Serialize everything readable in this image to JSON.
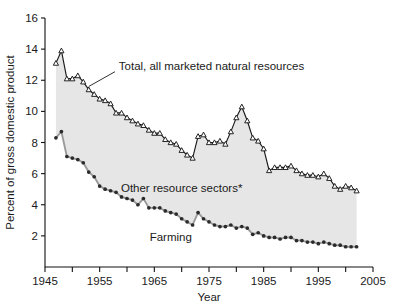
{
  "chart_data": {
    "type": "line",
    "title": "",
    "xlabel": "Year",
    "ylabel": "Percent of gross domestic product",
    "xlim": [
      1945,
      2005
    ],
    "ylim": [
      0,
      16
    ],
    "xticks": [
      1945,
      1950,
      1955,
      1960,
      1965,
      1970,
      1975,
      1980,
      1985,
      1990,
      1995,
      2000,
      2005
    ],
    "xticklabels": [
      "1945",
      "",
      "1955",
      "",
      "1965",
      "",
      "1975",
      "",
      "1985",
      "",
      "1995",
      "",
      "2005"
    ],
    "yticks": [
      2,
      4,
      6,
      8,
      10,
      12,
      14,
      16
    ],
    "yticklabels": [
      "2",
      "4",
      "6",
      "8",
      "10",
      "12",
      "14",
      "16"
    ],
    "grid": false,
    "legend_position": "inline-annotations",
    "annotations": [
      {
        "name": "total-series-label",
        "text": "Total, all marketed natural resources",
        "x": 1958.5,
        "y": 12.9
      },
      {
        "name": "band-label",
        "text": "Other resource sectors*",
        "x": 1970.0,
        "y": 5.05
      },
      {
        "name": "farming-series-label",
        "text": "Farming",
        "x": 1968.0,
        "y": 1.95
      }
    ],
    "x": [
      1947,
      1948,
      1949,
      1950,
      1951,
      1952,
      1953,
      1954,
      1955,
      1956,
      1957,
      1958,
      1959,
      1960,
      1961,
      1962,
      1963,
      1964,
      1965,
      1966,
      1967,
      1968,
      1969,
      1970,
      1971,
      1972,
      1973,
      1974,
      1975,
      1976,
      1977,
      1978,
      1979,
      1980,
      1981,
      1982,
      1983,
      1984,
      1985,
      1986,
      1987,
      1988,
      1989,
      1990,
      1991,
      1992,
      1993,
      1994,
      1995,
      1996,
      1997,
      1998,
      1999,
      2000,
      2001,
      2002
    ],
    "series": [
      {
        "name": "Total, all marketed natural resources",
        "marker": "open-triangle",
        "color": "#1a1a1a",
        "values": [
          13.1,
          13.9,
          12.1,
          12.1,
          12.3,
          11.9,
          11.4,
          11.1,
          10.8,
          10.7,
          10.5,
          9.9,
          9.9,
          9.6,
          9.4,
          9.2,
          9.1,
          8.8,
          8.6,
          8.6,
          8.2,
          8.0,
          7.9,
          7.5,
          7.2,
          7.0,
          8.4,
          8.5,
          8.0,
          8.0,
          8.1,
          7.9,
          8.7,
          9.6,
          10.3,
          9.4,
          8.3,
          8.1,
          7.6,
          6.2,
          6.4,
          6.4,
          6.4,
          6.5,
          6.2,
          6.0,
          5.9,
          5.9,
          5.8,
          6.0,
          5.7,
          5.2,
          5.0,
          5.2,
          5.1,
          4.9
        ]
      },
      {
        "name": "Farming",
        "marker": "filled-dot",
        "color": "#2b2b2b",
        "values": [
          8.3,
          8.7,
          7.1,
          7.0,
          6.9,
          6.7,
          6.1,
          5.8,
          5.2,
          5.0,
          4.9,
          4.8,
          4.5,
          4.4,
          4.3,
          4.0,
          4.4,
          3.8,
          3.8,
          3.8,
          3.6,
          3.5,
          3.4,
          3.1,
          2.9,
          2.7,
          3.5,
          3.1,
          2.9,
          2.7,
          2.6,
          2.6,
          2.7,
          2.5,
          2.6,
          2.5,
          2.1,
          2.2,
          2.0,
          1.9,
          1.9,
          1.8,
          1.9,
          1.9,
          1.7,
          1.7,
          1.6,
          1.6,
          1.5,
          1.6,
          1.5,
          1.4,
          1.4,
          1.3,
          1.3,
          1.3
        ]
      }
    ]
  }
}
